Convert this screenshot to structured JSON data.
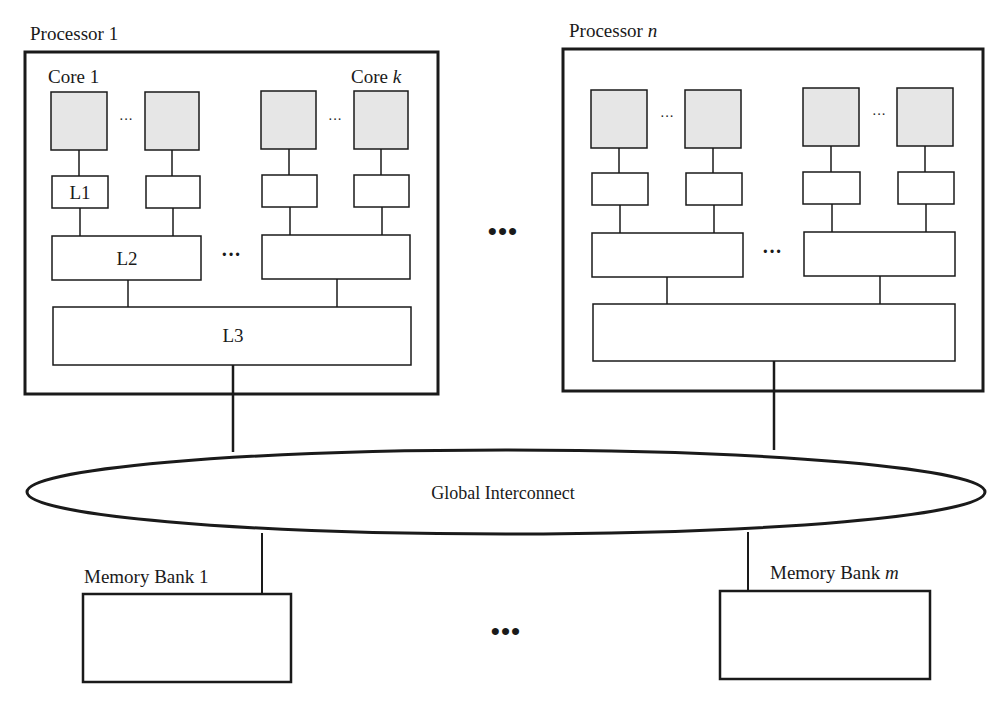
{
  "colors": {
    "stroke": "#1a1a1a",
    "core_fill": "#e6e6e6",
    "background": "#ffffff"
  },
  "processors": [
    {
      "title": "Processor 1",
      "title_main": "Processor ",
      "title_index": "1",
      "core_first_label": "Core 1",
      "core_last_label_main": "Core ",
      "core_last_label_index": "k",
      "l1_label": "L1",
      "l2_label": "L2",
      "l3_label": "L3",
      "core_ellipsis": "···",
      "l2_ellipsis": "···"
    },
    {
      "title": "Processor n",
      "title_main": "Processor ",
      "title_index": "n",
      "core_ellipsis": "···",
      "l2_ellipsis": "···"
    }
  ],
  "between_processors_ellipsis": "•••",
  "interconnect": {
    "label": "Global Interconnect"
  },
  "memory_banks": [
    {
      "label": "Memory Bank 1",
      "label_main": "Memory Bank ",
      "label_index": "1"
    },
    {
      "label": "Memory Bank m",
      "label_main": "Memory Bank ",
      "label_index": "m"
    }
  ],
  "between_banks_ellipsis": "•••"
}
